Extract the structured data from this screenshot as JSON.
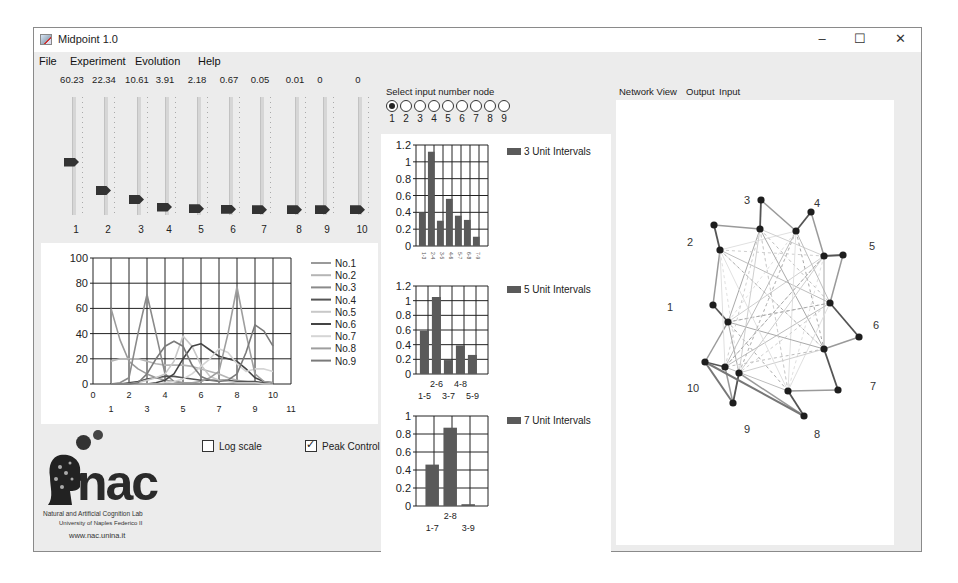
{
  "window": {
    "title": "Midpoint 1.0",
    "controls": {
      "minimize": "–",
      "maximize": "☐",
      "close": "✕"
    }
  },
  "menu": [
    "File",
    "Experiment",
    "Evolution",
    "Help"
  ],
  "sliders": {
    "values": [
      "60.23",
      "22.34",
      "10.61",
      "3.91",
      "2.18",
      "0.67",
      "0.05",
      "0.01",
      "0",
      "0"
    ],
    "labels": [
      "1",
      "2",
      "3",
      "4",
      "5",
      "6",
      "7",
      "8",
      "9",
      "10"
    ],
    "thumb_positions": [
      0.55,
      0.81,
      0.89,
      0.96,
      0.975,
      0.98,
      0.985,
      0.985,
      0.985,
      0.985
    ]
  },
  "options": {
    "log_scale": {
      "label": "Log scale",
      "checked": false
    },
    "peak_control": {
      "label": "Peak Control",
      "checked": true
    }
  },
  "logo": {
    "name": "nac",
    "line1": "Natural and Artificial Cognition Lab",
    "line2": "University of Naples Federico II",
    "url": "www.nac.unina.it"
  },
  "input_node": {
    "label": "Select input number node",
    "options": [
      "1",
      "2",
      "3",
      "4",
      "5",
      "6",
      "7",
      "8",
      "9"
    ],
    "selected": "1"
  },
  "tabs": [
    "Network View",
    "Output",
    "Input"
  ],
  "network": {
    "node_labels": [
      "1",
      "2",
      "3",
      "4",
      "5",
      "6",
      "7",
      "8",
      "9",
      "10"
    ]
  },
  "chart_data": [
    {
      "type": "line",
      "title": "",
      "xlabel": "",
      "ylabel": "",
      "xlim": [
        0,
        11
      ],
      "ylim": [
        0,
        100
      ],
      "x_ticks_top": [
        "0",
        "2",
        "4",
        "6",
        "8",
        "10"
      ],
      "x_ticks_bottom": [
        "1",
        "3",
        "5",
        "7",
        "9",
        "11"
      ],
      "y_ticks": [
        "0",
        "20",
        "40",
        "60",
        "80",
        "100"
      ],
      "grid": true,
      "legend_position": "right",
      "x": [
        1,
        1.5,
        2,
        2.5,
        3,
        3.5,
        4,
        4.5,
        5,
        5.5,
        6,
        6.5,
        7,
        7.5,
        8,
        8.5,
        9,
        9.5,
        10
      ],
      "series": [
        {
          "name": "No.1",
          "color": "#9a9a9a",
          "values": [
            60,
            35,
            18,
            12,
            8,
            5,
            3,
            2,
            1,
            1,
            0,
            0,
            0,
            0,
            0,
            0,
            0,
            0,
            0
          ]
        },
        {
          "name": "No.2",
          "color": "#b5b5b5",
          "values": [
            18,
            20,
            20,
            20,
            18,
            16,
            15,
            15,
            15,
            14,
            12,
            10,
            8,
            5,
            3,
            2,
            1,
            1,
            0
          ]
        },
        {
          "name": "No.3",
          "color": "#8a8a8a",
          "values": [
            0,
            1,
            5,
            40,
            71,
            40,
            8,
            2,
            1,
            0,
            0,
            0,
            0,
            0,
            0,
            0,
            0,
            0,
            0
          ]
        },
        {
          "name": "No.4",
          "color": "#555555",
          "values": [
            0,
            0,
            1,
            2,
            4,
            5,
            6,
            6,
            5,
            4,
            3,
            3,
            3,
            3,
            2,
            2,
            2,
            1,
            1
          ]
        },
        {
          "name": "No.5",
          "color": "#c8c8c8",
          "values": [
            0,
            0,
            0,
            1,
            3,
            5,
            8,
            18,
            38,
            30,
            15,
            6,
            3,
            2,
            1,
            1,
            1,
            0,
            0
          ]
        },
        {
          "name": "No.6",
          "color": "#444444",
          "values": [
            0,
            0,
            0,
            0,
            0,
            1,
            3,
            8,
            20,
            30,
            32,
            27,
            22,
            20,
            18,
            12,
            5,
            2,
            1
          ]
        },
        {
          "name": "No.7",
          "color": "#d5d5d5",
          "values": [
            0,
            0,
            0,
            0,
            0,
            0,
            1,
            2,
            4,
            8,
            14,
            20,
            28,
            25,
            16,
            10,
            12,
            12,
            10
          ]
        },
        {
          "name": "No.8",
          "color": "#9e9e9e",
          "values": [
            0,
            0,
            0,
            0,
            0,
            0,
            0,
            0,
            1,
            1,
            2,
            5,
            10,
            40,
            77,
            40,
            8,
            2,
            1
          ]
        },
        {
          "name": "No.9",
          "color": "#7a7a7a",
          "values": [
            0,
            0,
            0,
            1,
            8,
            20,
            30,
            34,
            30,
            15,
            6,
            3,
            2,
            3,
            8,
            25,
            47,
            42,
            30
          ]
        }
      ]
    },
    {
      "type": "bar",
      "title": "",
      "legend": "3 Unit Intervals",
      "categories": [
        "1-3",
        "2-4",
        "3-5",
        "4-6",
        "5-7",
        "6-8",
        "7-9"
      ],
      "values": [
        0.4,
        1.12,
        0.3,
        0.56,
        0.36,
        0.31,
        0.11
      ],
      "y_ticks": [
        "0",
        "0.2",
        "0.4",
        "0.6",
        "0.8",
        "1",
        "1.2"
      ],
      "ylim": [
        0,
        1.2
      ],
      "grid": true,
      "color": "#5a5a5a"
    },
    {
      "type": "bar",
      "title": "",
      "legend": "5 Unit Intervals",
      "categories": [
        "1-5",
        "2-6",
        "3-7",
        "4-8",
        "5-9"
      ],
      "values": [
        0.59,
        1.05,
        0.19,
        0.39,
        0.26
      ],
      "y_ticks": [
        "0",
        "0.2",
        "0.4",
        "0.6",
        "0.8",
        "1",
        "1.2"
      ],
      "ylim": [
        0,
        1.2
      ],
      "grid": true,
      "color": "#5a5a5a"
    },
    {
      "type": "bar",
      "title": "",
      "legend": "7 Unit Intervals",
      "categories": [
        "1-7",
        "2-8",
        "3-9"
      ],
      "values": [
        0.46,
        0.87,
        0.02
      ],
      "y_ticks": [
        "0",
        "0.2",
        "0.4",
        "0.6",
        "0.8",
        "1"
      ],
      "ylim": [
        0,
        1
      ],
      "grid": true,
      "color": "#5a5a5a"
    }
  ]
}
